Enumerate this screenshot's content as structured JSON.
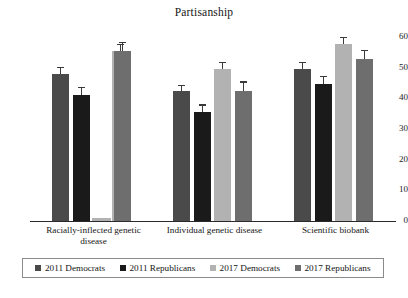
{
  "chart_data": {
    "type": "bar",
    "title": "Partisanship",
    "xlabel": "",
    "ylabel": "",
    "ylim": [
      0,
      60
    ],
    "yticks": [
      0,
      10,
      20,
      30,
      40,
      50,
      60
    ],
    "ytick_labels": [
      "0",
      "10",
      "20",
      "30",
      "40",
      "50",
      "60"
    ],
    "grid": false,
    "legend_position": "bottom",
    "categories": [
      "Racially-inflected genetic disease",
      "Individual genetic disease",
      "Scientific biobank"
    ],
    "series": [
      {
        "name": "2011 Democrats",
        "color": "#4a4a4a",
        "values": [
          48.0,
          42.5,
          49.7
        ],
        "errors": [
          2.2,
          1.8,
          2.2
        ]
      },
      {
        "name": "2011 Republicans",
        "color": "#1a1a1a",
        "values": [
          41.2,
          35.5,
          44.8
        ],
        "errors": [
          2.5,
          2.5,
          2.5
        ]
      },
      {
        "name": "2017 Democrats",
        "color": "#b2b2b2",
        "values": [
          55.3,
          49.5,
          57.8
        ],
        "errors": [
          2.3,
          2.3,
          2.3
        ]
      },
      {
        "name": "2017 Republicans",
        "color": "#6e6e6e",
        "values": [
          55.3,
          42.5,
          52.7
        ],
        "errors": [
          3.0,
          3.0,
          3.2
        ]
      }
    ],
    "annotations": [
      {
        "group": "Racially-inflected genetic disease",
        "series": "2017 Democrats",
        "note": "near-zero stub bar rendered at baseline",
        "stub_value": 1.0
      }
    ]
  },
  "axis": {
    "tick_0": "0",
    "tick_10": "10",
    "tick_20": "20",
    "tick_30": "30",
    "tick_40": "40",
    "tick_50": "50",
    "tick_60": "60"
  },
  "categories": {
    "cat_0_line_1": "Racially-inflected genetic",
    "cat_0_line_2": "disease",
    "cat_1_line_1": "Individual genetic disease",
    "cat_1_line_2": "",
    "cat_2_line_1": "Scientific biobank",
    "cat_2_line_2": ""
  },
  "legend": {
    "items": [
      {
        "label": "2011 Democrats",
        "color": "#4a4a4a"
      },
      {
        "label": "2011 Republicans",
        "color": "#1a1a1a"
      },
      {
        "label": "2017 Democrats",
        "color": "#b2b2b2"
      },
      {
        "label": "2017 Republicans",
        "color": "#6e6e6e"
      }
    ]
  }
}
